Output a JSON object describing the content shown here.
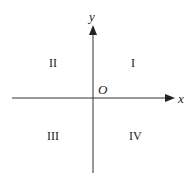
{
  "diagram": {
    "axes": {
      "x_label": "x",
      "y_label": "y",
      "origin_label": "O"
    },
    "quadrants": [
      {
        "id": "I",
        "label": "I"
      },
      {
        "id": "II",
        "label": "II"
      },
      {
        "id": "III",
        "label": "III"
      },
      {
        "id": "IV",
        "label": "IV"
      }
    ],
    "colors": {
      "axis": "#333333",
      "text": "#222222",
      "background": "#ffffff"
    }
  }
}
